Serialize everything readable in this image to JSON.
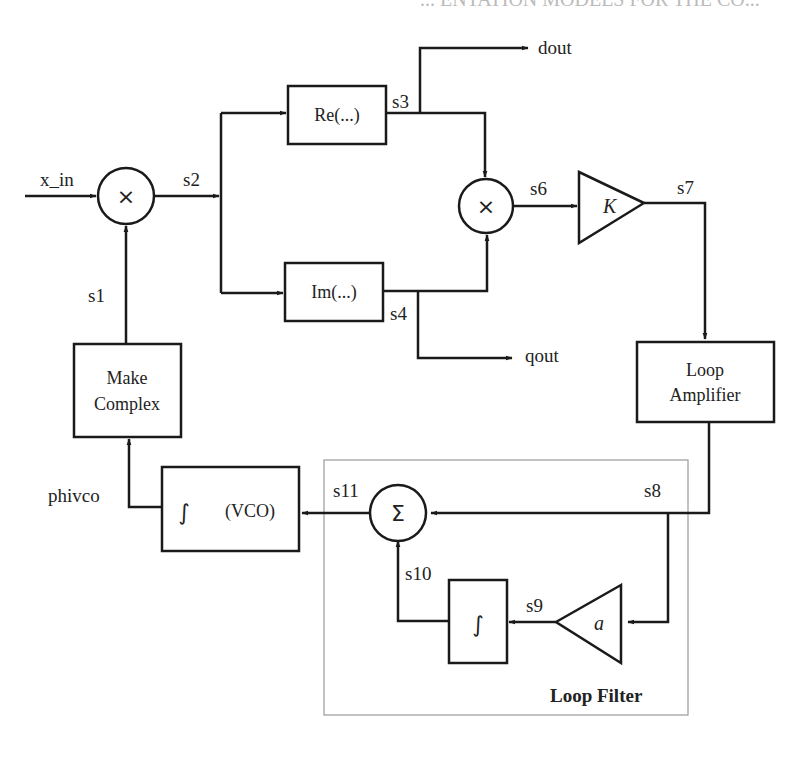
{
  "header_fragment": "... ENTATION MODELS FOR THE CO...",
  "signals": {
    "x_in": "x_in",
    "s1": "s1",
    "s2": "s2",
    "s3": "s3",
    "s4": "s4",
    "s6": "s6",
    "s7": "s7",
    "s8": "s8",
    "s9": "s9",
    "s10": "s10",
    "s11": "s11",
    "dout": "dout",
    "qout": "qout",
    "phivco": "phivco"
  },
  "blocks": {
    "mixer1": "×",
    "mixer2": "×",
    "re": "Re(...)",
    "im": "Im(...)",
    "gain_k": "K",
    "loop_amp_line1": "Loop",
    "loop_amp_line2": "Amplifier",
    "make_complex_line1": "Make",
    "make_complex_line2": "Complex",
    "vco_integral": "∫",
    "vco_label": "(VCO)",
    "summer": "Σ",
    "integrator": "∫",
    "gain_a": "a"
  },
  "groups": {
    "loop_filter": "Loop Filter"
  },
  "colors": {
    "line": "#1a1a1a",
    "frame": "#9a9a9a",
    "text": "#222222"
  }
}
